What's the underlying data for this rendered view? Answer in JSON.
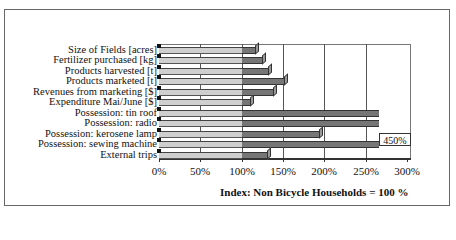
{
  "chart_data": {
    "type": "bar",
    "orientation": "horizontal",
    "style": "3d",
    "title": "",
    "xlabel": "Index: Non Bicycle Households = 100 %",
    "ylabel": "",
    "xlim": [
      0,
      300
    ],
    "x_ticks": [
      "0%",
      "50%",
      "100%",
      "150%",
      "200%",
      "250%",
      "300%"
    ],
    "grid": "vertical",
    "categories": [
      "Size of Fields [acres]",
      "Fertilizer purchased [kg]",
      "Products harvested [t]",
      "Products marketed  [t]",
      "Revenues from marketing [$]",
      "Expenditure Mai/June [$]",
      "Possession: tin roof",
      "Possession: radio",
      "Possession: kerosene lamp",
      "Possession: sewing machine",
      "External trips"
    ],
    "values": [
      117,
      126,
      133,
      152,
      139,
      111,
      283,
      270,
      195,
      450,
      132
    ],
    "annotations": [
      {
        "category": "Possession: sewing machine",
        "text": "450%",
        "note": "bar exceeds axis range"
      }
    ],
    "colors": {
      "baseline_part": "#cfcfcf",
      "excess_part": "#767676"
    }
  },
  "labels": {
    "cats": [
      "Size of Fields [acres]",
      "Fertilizer purchased [kg]",
      "Products harvested [t]",
      "Products marketed  [t]",
      "Revenues from marketing [$]",
      "Expenditure Mai/June [$]",
      "Possession: tin roof",
      "Possession: radio",
      "Possession: kerosene lamp",
      "Possession: sewing machine",
      "External trips"
    ],
    "ticks": [
      "0%",
      "50%",
      "100%",
      "150%",
      "200%",
      "250%",
      "300%"
    ],
    "xtitle": "Index: Non Bicycle Households = 100 %",
    "overflow": "450%"
  }
}
